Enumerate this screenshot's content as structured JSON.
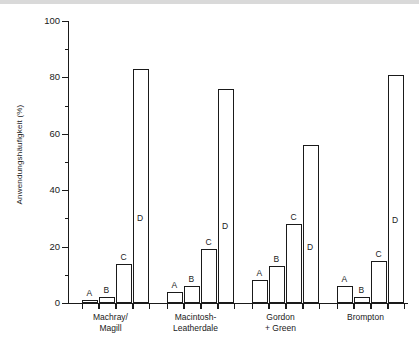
{
  "chart_data": {
    "type": "bar",
    "title": "",
    "xlabel": "",
    "ylabel": "Anwendungshäufigkeit (%)",
    "ylim": [
      0,
      100
    ],
    "ytick_labels": [
      "0",
      "20",
      "40",
      "60",
      "80",
      "100"
    ],
    "ytick_values": [
      0,
      20,
      40,
      60,
      80,
      100
    ],
    "yminor_values": [
      10,
      30,
      50,
      70,
      90
    ],
    "grid": false,
    "legend": "none",
    "series_labels": [
      "A",
      "B",
      "C",
      "D"
    ],
    "categories": [
      "Machray/Magill",
      "Macintosh-Leatherdale",
      "Gordon + Green",
      "Brompton"
    ],
    "series": [
      {
        "name": "A",
        "values": [
          1,
          4,
          8,
          6
        ]
      },
      {
        "name": "B",
        "values": [
          2,
          6,
          13,
          2
        ]
      },
      {
        "name": "C",
        "values": [
          14,
          19,
          28,
          15
        ]
      },
      {
        "name": "D",
        "values": [
          83,
          76,
          56,
          81
        ]
      }
    ],
    "groups": [
      {
        "label_lines": [
          "Machray/",
          "Magill"
        ],
        "bars": [
          {
            "letter": "A",
            "value": 1
          },
          {
            "letter": "B",
            "value": 2
          },
          {
            "letter": "C",
            "value": 14
          },
          {
            "letter": "D",
            "value": 83
          }
        ]
      },
      {
        "label_lines": [
          "Macintosh-",
          "Leatherdale"
        ],
        "bars": [
          {
            "letter": "A",
            "value": 4
          },
          {
            "letter": "B",
            "value": 6
          },
          {
            "letter": "C",
            "value": 19
          },
          {
            "letter": "D",
            "value": 76
          }
        ]
      },
      {
        "label_lines": [
          "Gordon",
          "+ Green"
        ],
        "bars": [
          {
            "letter": "A",
            "value": 8
          },
          {
            "letter": "B",
            "value": 13
          },
          {
            "letter": "C",
            "value": 28
          },
          {
            "letter": "D",
            "value": 56
          }
        ]
      },
      {
        "label_lines": [
          "Brompton",
          ""
        ],
        "bars": [
          {
            "letter": "A",
            "value": 6
          },
          {
            "letter": "B",
            "value": 2
          },
          {
            "letter": "C",
            "value": 15
          },
          {
            "letter": "D",
            "value": 81
          }
        ]
      }
    ],
    "colors": {
      "bar_fill": "#ffffff",
      "bar_stroke": "#1a1a1a",
      "axis": "#1a1a1a",
      "background": "#ffffff"
    }
  }
}
